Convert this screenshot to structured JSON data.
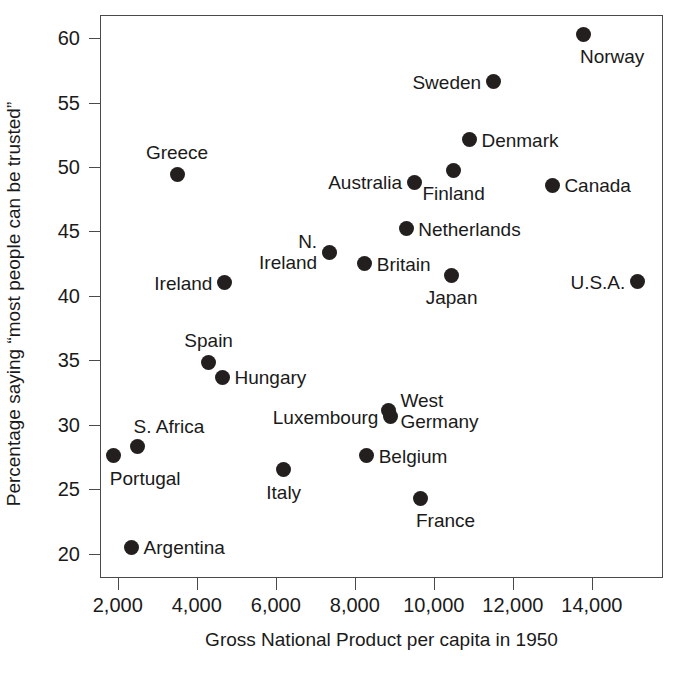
{
  "chart_data": {
    "type": "scatter",
    "title": "",
    "xlabel": "Gross National Product per capita in 1950",
    "ylabel": "Percentage saying “most people can be trusted”",
    "xlim": [
      1550,
      15800
    ],
    "ylim": [
      18.1,
      61.8
    ],
    "grid": false,
    "legend": null,
    "xticks": [
      2000,
      4000,
      6000,
      8000,
      10000,
      12000,
      14000
    ],
    "xtick_labels": [
      "2,000",
      "4,000",
      "6,000",
      "8,000",
      "10,000",
      "12,000",
      "14,000"
    ],
    "yticks": [
      20,
      25,
      30,
      35,
      40,
      45,
      50,
      55,
      60
    ],
    "ytick_labels": [
      "20",
      "25",
      "30",
      "35",
      "40",
      "45",
      "50",
      "55",
      "60"
    ],
    "marker": {
      "shape": "circle",
      "color": "#241f1f",
      "size": 15
    },
    "points": [
      {
        "name": "Norway",
        "x": 13800,
        "y": 60.3,
        "label": "Norway",
        "label_pos": "below-right"
      },
      {
        "name": "Sweden",
        "x": 11500,
        "y": 56.6,
        "label": "Sweden",
        "label_pos": "left"
      },
      {
        "name": "Denmark",
        "x": 10900,
        "y": 52.1,
        "label": "Denmark",
        "label_pos": "right"
      },
      {
        "name": "Greece",
        "x": 3500,
        "y": 49.4,
        "label": "Greece",
        "label_pos": "above"
      },
      {
        "name": "Canada",
        "x": 13000,
        "y": 48.6,
        "label": "Canada",
        "label_pos": "right"
      },
      {
        "name": "Australia",
        "x": 9500,
        "y": 48.8,
        "label": "Australia",
        "label_pos": "left"
      },
      {
        "name": "Finland",
        "x": 10500,
        "y": 49.7,
        "label": "Finland",
        "label_pos": "below"
      },
      {
        "name": "Netherlands",
        "x": 9300,
        "y": 45.2,
        "label": "Netherlands",
        "label_pos": "right"
      },
      {
        "name": "N. Ireland",
        "x": 7350,
        "y": 43.4,
        "label": "N.\nIreland",
        "label_pos": "left"
      },
      {
        "name": "Britain",
        "x": 8250,
        "y": 42.5,
        "label": "Britain",
        "label_pos": "right"
      },
      {
        "name": "Japan",
        "x": 10450,
        "y": 41.6,
        "label": "Japan",
        "label_pos": "below"
      },
      {
        "name": "U.S.A.",
        "x": 15150,
        "y": 41.1,
        "label": "U.S.A.",
        "label_pos": "left"
      },
      {
        "name": "Ireland",
        "x": 4700,
        "y": 41.0,
        "label": "Ireland",
        "label_pos": "left"
      },
      {
        "name": "Spain",
        "x": 4300,
        "y": 34.8,
        "label": "Spain",
        "label_pos": "above"
      },
      {
        "name": "Hungary",
        "x": 4650,
        "y": 33.7,
        "label": "Hungary",
        "label_pos": "right"
      },
      {
        "name": "West Germany",
        "x": 8850,
        "y": 31.1,
        "label": "West\nGermany",
        "label_pos": "right"
      },
      {
        "name": "Luxembourg",
        "x": 8900,
        "y": 30.6,
        "label": "Luxembourg",
        "label_pos": "left"
      },
      {
        "name": "S. Africa",
        "x": 2500,
        "y": 28.3,
        "label": "S. Africa",
        "label_pos": "above-right"
      },
      {
        "name": "Portugal",
        "x": 1900,
        "y": 27.6,
        "label": "Portugal",
        "label_pos": "below-right"
      },
      {
        "name": "Belgium",
        "x": 8300,
        "y": 27.6,
        "label": "Belgium",
        "label_pos": "right"
      },
      {
        "name": "Italy",
        "x": 6200,
        "y": 26.5,
        "label": "Italy",
        "label_pos": "below"
      },
      {
        "name": "France",
        "x": 9650,
        "y": 24.3,
        "label": "France",
        "label_pos": "below-right"
      },
      {
        "name": "Argentina",
        "x": 2350,
        "y": 20.5,
        "label": "Argentina",
        "label_pos": "right"
      }
    ]
  }
}
